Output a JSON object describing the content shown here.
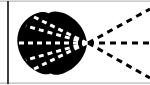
{
  "figure": {
    "canvas": {
      "width": 150,
      "height": 85,
      "background": "#ffffff"
    },
    "colors": {
      "ink": "#0a0a0a",
      "blob_fill": "#000000",
      "inner_ray": "#ffffff",
      "outer_ray": "#000000",
      "frame_rule": "#b9b9b9",
      "background": "#ffffff"
    },
    "frame": {
      "top_rule": {
        "label": "top border rule",
        "y": 1,
        "x1": 0,
        "x2": 150,
        "thickness": 1
      },
      "bottom_rule": {
        "label": "bottom border rule",
        "y": 83,
        "x1": 0,
        "x2": 150,
        "thickness": 1
      },
      "left_vertical_rule": {
        "label": "left vertical rule",
        "x": 8,
        "y1": 1,
        "y2": 83,
        "thickness": 2
      }
    },
    "blob": {
      "label": "solid black lobe",
      "fill": "#000000",
      "center_x": 53,
      "center_y": 43,
      "left_extent": 18,
      "right_apex_x": 89,
      "top_extent": 11,
      "bottom_extent": 76,
      "notch_top": {
        "x": 48,
        "y": 13
      },
      "notch_bottom": {
        "x": 50,
        "y": 74
      }
    },
    "focal_point": {
      "label": "ray convergence point",
      "x": 87,
      "y": 43
    },
    "inner_rays": {
      "label": "white dashed rays inside lobe",
      "color": "#ffffff",
      "dash": "5 4",
      "width": 3,
      "count": 5,
      "endpoints": [
        {
          "name": "inner-ray-upper-outer",
          "x": 34,
          "y": 17
        },
        {
          "name": "inner-ray-upper-inner",
          "x": 27,
          "y": 26
        },
        {
          "name": "inner-ray-axis",
          "x": 20,
          "y": 43
        },
        {
          "name": "inner-ray-lower-inner",
          "x": 27,
          "y": 60
        },
        {
          "name": "inner-ray-lower-outer",
          "x": 34,
          "y": 69
        }
      ]
    },
    "outer_rays": {
      "label": "black dashed rays outside lobe",
      "color": "#000000",
      "dash": "6 5",
      "width": 3,
      "count": 3,
      "endpoints": [
        {
          "name": "outer-ray-upper",
          "x": 149,
          "y": 10
        },
        {
          "name": "outer-ray-axis",
          "x": 149,
          "y": 43
        },
        {
          "name": "outer-ray-lower",
          "x": 149,
          "y": 77
        }
      ]
    }
  }
}
